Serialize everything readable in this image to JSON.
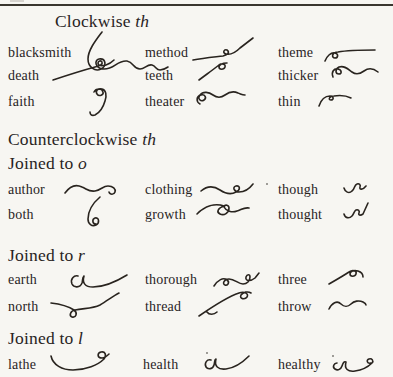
{
  "page": {
    "paper_color": "#f7f6f2",
    "ink_color": "#29241f",
    "top_rule": true
  },
  "sections": [
    {
      "id": "clockwise-th",
      "heading": {
        "text": "Clockwise ",
        "italic": "th"
      },
      "entries": [
        {
          "word": "blacksmith",
          "symbol": "blacksmith-shorthand-outline"
        },
        {
          "word": "method",
          "symbol": "method-shorthand-outline"
        },
        {
          "word": "theme",
          "symbol": "theme-shorthand-outline"
        },
        {
          "word": "death",
          "symbol": "death-shorthand-outline"
        },
        {
          "word": "teeth",
          "symbol": "teeth-shorthand-outline"
        },
        {
          "word": "thicker",
          "symbol": "thicker-shorthand-outline"
        },
        {
          "word": "faith",
          "symbol": "faith-shorthand-outline"
        },
        {
          "word": "theater",
          "symbol": "theater-shorthand-outline"
        },
        {
          "word": "thin",
          "symbol": "thin-shorthand-outline"
        }
      ]
    },
    {
      "id": "counterclockwise-th",
      "heading": {
        "text": "Counterclockwise ",
        "italic": "th"
      },
      "entries": []
    },
    {
      "id": "joined-to-o",
      "heading": {
        "text": "Joined to ",
        "italic": "o"
      },
      "entries": [
        {
          "word": "author",
          "symbol": "author-shorthand-outline"
        },
        {
          "word": "clothing",
          "symbol": "clothing-shorthand-outline"
        },
        {
          "word": "though",
          "symbol": "though-shorthand-outline"
        },
        {
          "word": "both",
          "symbol": "both-shorthand-outline"
        },
        {
          "word": "growth",
          "symbol": "growth-shorthand-outline"
        },
        {
          "word": "thought",
          "symbol": "thought-shorthand-outline"
        }
      ]
    },
    {
      "id": "joined-to-r",
      "heading": {
        "text": "Joined to ",
        "italic": "r"
      },
      "entries": [
        {
          "word": "earth",
          "symbol": "earth-shorthand-outline"
        },
        {
          "word": "thorough",
          "symbol": "thorough-shorthand-outline"
        },
        {
          "word": "three",
          "symbol": "three-shorthand-outline"
        },
        {
          "word": "north",
          "symbol": "north-shorthand-outline"
        },
        {
          "word": "thread",
          "symbol": "thread-shorthand-outline"
        },
        {
          "word": "throw",
          "symbol": "throw-shorthand-outline"
        }
      ]
    },
    {
      "id": "joined-to-l",
      "heading": {
        "text": "Joined to ",
        "italic": "l"
      },
      "entries": [
        {
          "word": "lathe",
          "symbol": "lathe-shorthand-outline"
        },
        {
          "word": "health",
          "symbol": "health-shorthand-outline"
        },
        {
          "word": "healthy",
          "symbol": "healthy-shorthand-outline"
        }
      ]
    }
  ]
}
